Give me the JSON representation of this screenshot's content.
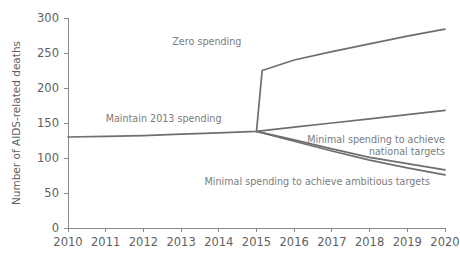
{
  "chart_data": {
    "type": "line",
    "title": "",
    "xlabel": "",
    "ylabel": "Number of AIDS-related deaths",
    "xlim": [
      2010,
      2020
    ],
    "ylim": [
      0,
      300
    ],
    "grid": false,
    "legend_position": "inline-annotations",
    "x_ticks": [
      "2010",
      "2011",
      "2012",
      "2013",
      "2014",
      "2015",
      "2016",
      "2017",
      "2018",
      "2019",
      "2020"
    ],
    "y_ticks": [
      "0",
      "50",
      "100",
      "150",
      "200",
      "250",
      "300"
    ],
    "x": [
      2010,
      2011,
      2012,
      2013,
      2014,
      2015,
      2016,
      2017,
      2018,
      2019,
      2020
    ],
    "series": [
      {
        "name": "Maintain 2013 spending",
        "color": "#6e6e6e",
        "x": [
          2010,
          2011,
          2012,
          2013,
          2014,
          2015,
          2016,
          2017,
          2018,
          2019,
          2020
        ],
        "values": [
          130,
          131,
          132,
          134,
          136,
          138,
          144,
          150,
          156,
          162,
          168
        ]
      },
      {
        "name": "Zero spending",
        "color": "#6e6e6e",
        "x": [
          2015,
          2015.15,
          2016,
          2017,
          2018,
          2019,
          2020
        ],
        "values": [
          138,
          225,
          240,
          252,
          263,
          274,
          284
        ]
      },
      {
        "name": "Minimal spending to achieve national targets",
        "color": "#6e6e6e",
        "x": [
          2015,
          2016,
          2017,
          2018,
          2019,
          2020
        ],
        "values": [
          138,
          126,
          113,
          101,
          92,
          83
        ]
      },
      {
        "name": "Minimal spending to achieve ambitious targets",
        "color": "#6e6e6e",
        "x": [
          2015,
          2016,
          2017,
          2018,
          2019,
          2020
        ],
        "values": [
          138,
          124,
          110,
          97,
          86,
          76
        ]
      }
    ],
    "annotations": [
      {
        "id": "maintain-2013-spending",
        "lines": [
          "Maintain 2013 spending"
        ],
        "x": 2011.0,
        "y": 152,
        "anchor": "start"
      },
      {
        "id": "zero-spending",
        "lines": [
          "Zero spending"
        ],
        "x": 2014.6,
        "y": 262,
        "anchor": "end"
      },
      {
        "id": "minimal-national-targets",
        "lines": [
          "Minimal spending to achieve",
          "national targets"
        ],
        "x": 2020.0,
        "y": 121,
        "anchor": "end"
      },
      {
        "id": "minimal-ambitious-targets",
        "lines": [
          "Minimal spending to achieve ambitious targets"
        ],
        "x": 2019.6,
        "y": 62,
        "anchor": "end"
      }
    ]
  }
}
